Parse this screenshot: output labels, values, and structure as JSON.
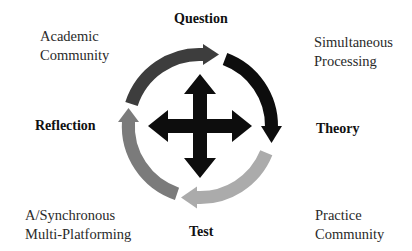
{
  "diagram": {
    "stages": {
      "question": "Question",
      "theory": "Theory",
      "test": "Test",
      "reflection": "Reflection"
    },
    "corner_notes": {
      "top_left": [
        "Academic",
        "Community"
      ],
      "top_right": [
        "Simultaneous",
        "Processing"
      ],
      "bottom_left": [
        "A/Synchronous",
        "Multi-Platforming"
      ],
      "bottom_right": [
        "Practice",
        "Community"
      ]
    },
    "arc_colors": {
      "top_left_arc": "#3d3d3d",
      "top_right_arc": "#0d0d0d",
      "bottom_right_arc": "#ababab",
      "bottom_left_arc": "#7b7b7b",
      "center_cross": "#0d0d0d"
    }
  }
}
